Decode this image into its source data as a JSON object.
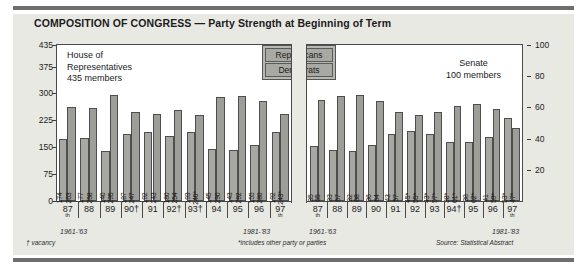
{
  "title": {
    "bold": "COMPOSITION OF CONGRESS",
    "dash": " — ",
    "rest": "Party Strength at Beginning of Term"
  },
  "legend": {
    "republicans": "Republicans",
    "democrats": "Democrats"
  },
  "house": {
    "caption_line1": "House of",
    "caption_line2": "Representatives",
    "caption_line3": "435 members",
    "range_left": "1961-'63",
    "range_right": "1981-'83",
    "footnote": "† vacancy"
  },
  "senate": {
    "caption_line1": "Senate",
    "caption_line2": "100 members",
    "range_left": "1961-'63",
    "range_right": "1981-'83",
    "source": "Source: Statistical Abstract"
  },
  "footnote_center": "*includes other party or parties",
  "axes": {
    "left_ticks": [
      "435",
      "375",
      "300",
      "225",
      "150",
      "75",
      "0"
    ],
    "right_ticks": [
      "100",
      "80",
      "60",
      "40",
      "20"
    ]
  },
  "colors": {
    "republican": "#a8a8a2",
    "democrat": "#9e9e98",
    "panel": "#e9e9e4",
    "frame": "#4a4a4a",
    "rule": "#6e6e6e"
  },
  "chart_data": {
    "type": "bar",
    "title": "COMPOSITION OF CONGRESS — Party Strength at Beginning of Term",
    "subtitle": "",
    "xlabel": "Congress",
    "ylabel": "Members",
    "grid": false,
    "legend_position": "top-center",
    "panels": [
      {
        "name": "House of Representatives",
        "members": 435,
        "ylim": [
          0,
          435
        ],
        "yticks": [
          0,
          75,
          150,
          225,
          300,
          375,
          435
        ],
        "categories": [
          "87th",
          "88",
          "89",
          "90†",
          "91",
          "92†",
          "93†",
          "94",
          "95",
          "96",
          "97th"
        ],
        "period_start": "1961-'63",
        "period_end": "1981-'83",
        "series": [
          {
            "name": "Republicans",
            "values": [
              174,
              177,
              140,
              187,
              192,
              180,
              193,
              145,
              143,
              155,
              192
            ],
            "labels": [
              "174",
              "177",
              "140",
              "187",
              "192",
              "180",
              "193",
              "145",
              "143",
              "155",
              "192"
            ]
          },
          {
            "name": "Democrats",
            "values": [
              263,
              258,
              295,
              247,
              243,
              254,
              240,
              290,
              292,
              280,
              243
            ],
            "labels": [
              "263",
              "258",
              "295",
              "247",
              "243",
              "254",
              "240*",
              "290",
              "292",
              "280",
              "243*"
            ]
          }
        ]
      },
      {
        "name": "Senate",
        "members": 100,
        "ylim": [
          0,
          100
        ],
        "yticks": [
          20,
          40,
          60,
          80,
          100
        ],
        "categories": [
          "87th",
          "88",
          "89",
          "90",
          "91",
          "92",
          "93",
          "94†",
          "95",
          "96",
          "97th"
        ],
        "period_start": "1961-'63",
        "period_end": "1981-'83",
        "series": [
          {
            "name": "Republicans",
            "values": [
              35,
              33,
              32,
              36,
              43,
              45,
              43,
              38,
              38,
              41,
              53
            ],
            "labels": [
              "35",
              "33",
              "32",
              "36",
              "43",
              "45*",
              "43*",
              "38*",
              "38",
              "41",
              "53*"
            ]
          },
          {
            "name": "Democrats",
            "values": [
              65,
              67,
              68,
              64,
              57,
              55,
              57,
              61,
              62,
              59,
              47
            ],
            "labels": [
              "65",
              "67",
              "68",
              "64",
              "57",
              "55*",
              "57*",
              "61*",
              "62*",
              "59*",
              "47*"
            ]
          }
        ]
      }
    ],
    "footnotes": [
      "† vacancy",
      "*includes other party or parties",
      "Source: Statistical Abstract"
    ]
  }
}
